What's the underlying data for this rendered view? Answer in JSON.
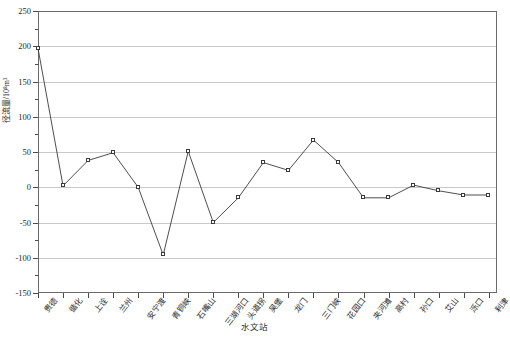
{
  "chart_data": {
    "type": "line",
    "title": "",
    "xlabel": "水文站",
    "ylabel": "径流量/10⁸m³",
    "ylim": [
      -150,
      250
    ],
    "ytick_values": [
      -150,
      -100,
      -50,
      0,
      50,
      100,
      150,
      200,
      250
    ],
    "ytick_labels": [
      "-150",
      "-100",
      "-50",
      "0",
      "50",
      "100",
      "150",
      "200",
      "250"
    ],
    "grid": true,
    "legend": "none",
    "marker": "open-square",
    "categories": [
      "贵德",
      "循化",
      "上诠",
      "兰州",
      "安宁渡",
      "青铜峡",
      "石嘴山",
      "三湖河口",
      "头道拐",
      "吴堡",
      "龙门",
      "三门峡",
      "花园口",
      "夹河滩",
      "高村",
      "孙口",
      "艾山",
      "泺口",
      "利津"
    ],
    "values": [
      197,
      2,
      38,
      49,
      0,
      -96,
      51,
      -50,
      -15,
      35,
      24,
      67,
      35,
      -15,
      -15,
      3,
      -5,
      -11,
      -11
    ]
  },
  "axis": {
    "y_title": "径流量/10⁸m³",
    "x_title": "水文站"
  }
}
